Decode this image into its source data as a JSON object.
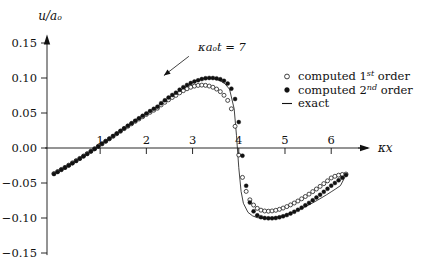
{
  "chart_data": {
    "type": "scatter",
    "title": "",
    "xlabel": "κx",
    "ylabel": "u/aₒ",
    "xlim": [
      -0.15,
      6.45
    ],
    "ylim": [
      -0.15,
      0.155
    ],
    "xticks": [
      1,
      2,
      3,
      4,
      5,
      6
    ],
    "xtick_labels": [
      "1",
      "2",
      "3",
      "4",
      "5",
      "6"
    ],
    "yticks": [
      -0.15,
      -0.1,
      -0.05,
      0.0,
      0.05,
      0.1,
      0.15
    ],
    "ytick_labels": [
      "-0.15",
      "-0.10",
      "-0.05",
      "0.00",
      "0.05",
      "0.10",
      "0.15"
    ],
    "grid": false,
    "legend_position": "upper right",
    "annotations": [
      {
        "text": "κaₒt = 7",
        "text_x": 3.12,
        "text_y": 0.139,
        "arrow_from_x": 2.92,
        "arrow_from_y": 0.131,
        "arrow_to_x": 2.38,
        "arrow_to_y": 0.1035
      }
    ],
    "series": [
      {
        "name": "computed 1st order",
        "marker": "open-circle",
        "x": [
          0.0,
          0.08,
          0.16,
          0.24,
          0.32,
          0.4,
          0.48,
          0.56,
          0.64,
          0.72,
          0.8,
          0.88,
          0.96,
          1.04,
          1.12,
          1.2,
          1.28,
          1.36,
          1.44,
          1.52,
          1.6,
          1.68,
          1.76,
          1.84,
          1.92,
          2.0,
          2.08,
          2.16,
          2.24,
          2.32,
          2.4,
          2.48,
          2.56,
          2.64,
          2.72,
          2.8,
          2.88,
          2.96,
          3.04,
          3.12,
          3.2,
          3.28,
          3.36,
          3.44,
          3.52,
          3.6,
          3.68,
          3.76,
          3.84,
          3.92,
          4.0,
          4.08,
          4.16,
          4.24,
          4.32,
          4.4,
          4.48,
          4.56,
          4.64,
          4.72,
          4.8,
          4.88,
          4.96,
          5.04,
          5.12,
          5.2,
          5.28,
          5.36,
          5.44,
          5.52,
          5.6,
          5.68,
          5.76,
          5.84,
          5.92,
          6.0,
          6.08,
          6.16,
          6.24,
          6.32
        ],
        "y": [
          -0.0365,
          -0.0336,
          -0.0306,
          -0.0276,
          -0.0245,
          -0.0213,
          -0.0181,
          -0.0148,
          -0.0115,
          -0.0081,
          -0.0046,
          -0.0011,
          0.0024,
          0.006,
          0.0096,
          0.0132,
          0.0168,
          0.0204,
          0.024,
          0.0276,
          0.0311,
          0.0346,
          0.0381,
          0.0414,
          0.0447,
          0.0479,
          0.051,
          0.054,
          0.0569,
          0.0615,
          0.0653,
          0.0689,
          0.0722,
          0.0752,
          0.0788,
          0.0819,
          0.0846,
          0.0868,
          0.0884,
          0.0894,
          0.0898,
          0.0895,
          0.0885,
          0.0868,
          0.0842,
          0.0805,
          0.0753,
          0.068,
          0.056,
          0.031,
          -0.01,
          -0.042,
          -0.062,
          -0.074,
          -0.0815,
          -0.0862,
          -0.0888,
          -0.09,
          -0.0903,
          -0.0899,
          -0.089,
          -0.0876,
          -0.0858,
          -0.0837,
          -0.0813,
          -0.0786,
          -0.0757,
          -0.0726,
          -0.0693,
          -0.0659,
          -0.0623,
          -0.0586,
          -0.0548,
          -0.0509,
          -0.0469,
          -0.0428,
          -0.0404,
          -0.0388,
          -0.0378,
          -0.0372
        ]
      },
      {
        "name": "computed 2nd order",
        "marker": "filled-circle",
        "x": [
          0.0,
          0.08,
          0.16,
          0.24,
          0.32,
          0.4,
          0.48,
          0.56,
          0.64,
          0.72,
          0.8,
          0.88,
          0.96,
          1.04,
          1.12,
          1.2,
          1.28,
          1.36,
          1.44,
          1.52,
          1.6,
          1.68,
          1.76,
          1.84,
          1.92,
          2.0,
          2.08,
          2.16,
          2.24,
          2.32,
          2.4,
          2.48,
          2.56,
          2.64,
          2.72,
          2.8,
          2.88,
          2.96,
          3.04,
          3.12,
          3.2,
          3.28,
          3.36,
          3.44,
          3.52,
          3.6,
          3.68,
          3.76,
          3.84,
          3.92,
          4.0,
          4.08,
          4.16,
          4.24,
          4.32,
          4.4,
          4.48,
          4.56,
          4.64,
          4.72,
          4.8,
          4.88,
          4.96,
          5.04,
          5.12,
          5.2,
          5.28,
          5.36,
          5.44,
          5.52,
          5.6,
          5.68,
          5.76,
          5.84,
          5.92,
          6.0,
          6.08,
          6.16,
          6.24,
          6.32
        ],
        "y": [
          -0.0372,
          -0.0342,
          -0.0312,
          -0.0281,
          -0.025,
          -0.0218,
          -0.0185,
          -0.0152,
          -0.0118,
          -0.0084,
          -0.0049,
          -0.0013,
          0.0023,
          0.0059,
          0.0096,
          0.0133,
          0.017,
          0.0207,
          0.0244,
          0.0281,
          0.0318,
          0.0354,
          0.039,
          0.0425,
          0.046,
          0.0494,
          0.0527,
          0.0559,
          0.059,
          0.064,
          0.0681,
          0.072,
          0.0757,
          0.0791,
          0.0833,
          0.0869,
          0.0901,
          0.0928,
          0.095,
          0.0967,
          0.0985,
          0.0996,
          0.1001,
          0.1,
          0.0994,
          0.0982,
          0.096,
          0.092,
          0.0848,
          0.07,
          0.037,
          -0.011,
          -0.054,
          -0.078,
          -0.0905,
          -0.0962,
          -0.0988,
          -0.1,
          -0.1005,
          -0.1005,
          -0.1,
          -0.099,
          -0.0976,
          -0.0958,
          -0.0936,
          -0.0911,
          -0.0883,
          -0.0852,
          -0.0819,
          -0.0784,
          -0.0747,
          -0.0708,
          -0.0668,
          -0.0626,
          -0.0583,
          -0.0538,
          -0.05,
          -0.0462,
          -0.0424,
          -0.0386
        ]
      },
      {
        "name": "exact",
        "marker": "line",
        "x": [
          0.0,
          0.1,
          0.2,
          0.3,
          0.4,
          0.5,
          0.6,
          0.7,
          0.8,
          0.9,
          1.0,
          1.1,
          1.2,
          1.3,
          1.4,
          1.5,
          1.6,
          1.7,
          1.8,
          1.9,
          2.0,
          2.1,
          2.2,
          2.3,
          2.4,
          2.5,
          2.6,
          2.7,
          2.8,
          2.9,
          3.0,
          3.1,
          3.2,
          3.3,
          3.4,
          3.5,
          3.6,
          3.7,
          3.8,
          3.9,
          3.95,
          4.0,
          4.05,
          4.1,
          4.2,
          4.3,
          4.4,
          4.5,
          4.6,
          4.7,
          4.8,
          4.9,
          5.0,
          5.1,
          5.2,
          5.3,
          5.4,
          5.5,
          5.6,
          5.7,
          5.8,
          5.9,
          6.0,
          6.1,
          6.2,
          6.32
        ],
        "y": [
          -0.0372,
          -0.0335,
          -0.0297,
          -0.0258,
          -0.0218,
          -0.0177,
          -0.0135,
          -0.0093,
          -0.0049,
          -0.0005,
          0.004,
          0.0085,
          0.0131,
          0.0177,
          0.0223,
          0.0269,
          0.0315,
          0.036,
          0.0405,
          0.0449,
          0.0492,
          0.0534,
          0.0575,
          0.0629,
          0.0677,
          0.0722,
          0.0765,
          0.081,
          0.0853,
          0.0893,
          0.0936,
          0.097,
          0.099,
          0.0999,
          0.0998,
          0.0985,
          0.096,
          0.0918,
          0.084,
          0.056,
          0.018,
          -0.028,
          -0.062,
          -0.079,
          -0.092,
          -0.097,
          -0.0995,
          -0.1003,
          -0.1005,
          -0.1,
          -0.099,
          -0.0976,
          -0.0958,
          -0.0936,
          -0.0911,
          -0.0883,
          -0.0852,
          -0.0819,
          -0.0784,
          -0.0747,
          -0.0708,
          -0.0668,
          -0.0626,
          -0.0583,
          -0.0538,
          -0.0386
        ]
      }
    ]
  },
  "legend": {
    "items": [
      {
        "marker": "open-circle",
        "label_prefix": "computed 1",
        "label_sup": "st",
        "label_suffix": " order"
      },
      {
        "marker": "filled-circle",
        "label_prefix": "computed 2",
        "label_sup": "nd",
        "label_suffix": " order"
      },
      {
        "marker": "line",
        "label_prefix": "exact",
        "label_sup": "",
        "label_suffix": ""
      }
    ]
  },
  "axes": {
    "y_axis_title": "u/aₒ",
    "x_axis_title": "κx"
  },
  "colors": {
    "ink": "#111111",
    "background": "#ffffff"
  }
}
